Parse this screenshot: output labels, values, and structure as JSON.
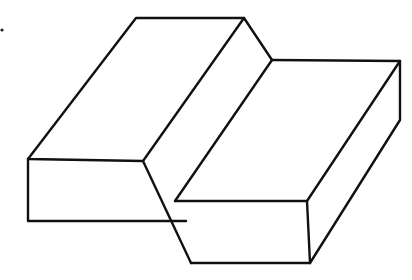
{
  "figure": {
    "stroke_color": "#111111",
    "background": "#ffffff",
    "shapes": [
      {
        "name": "left-block",
        "role": "taller rectangular block, left"
      },
      {
        "name": "right-block",
        "role": "lower rectangular block, right"
      }
    ]
  }
}
